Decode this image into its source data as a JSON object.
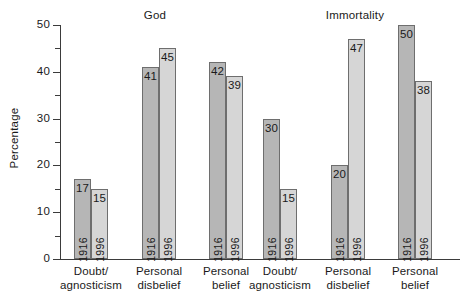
{
  "chart_data": {
    "type": "bar",
    "title": "",
    "xlabel": "",
    "ylabel": "Percentage",
    "ylim": [
      0,
      50
    ],
    "ytick_values": [
      0,
      10,
      20,
      30,
      40,
      50
    ],
    "ytick_labels": [
      "0",
      "10",
      "20",
      "30",
      "40",
      "50"
    ],
    "yminor_values": [
      5,
      15,
      25,
      35,
      45
    ],
    "grid": false,
    "legend_position": "none",
    "panels": [
      {
        "title": "God",
        "categories": [
          "Doubt/ agnosticism",
          "Personal disbelief",
          "Personal belief"
        ],
        "series": [
          {
            "name": "1916",
            "values": [
              17,
              41,
              42
            ]
          },
          {
            "name": "1996",
            "values": [
              15,
              45,
              39
            ]
          }
        ]
      },
      {
        "title": "Immortality",
        "categories": [
          "Doubt/ agnosticism",
          "Personal disbelief",
          "Personal belief"
        ],
        "series": [
          {
            "name": "1916",
            "values": [
              30,
              20,
              50
            ]
          },
          {
            "name": "1996",
            "values": [
              15,
              47,
              38
            ]
          }
        ]
      }
    ],
    "colors": {
      "bar_1916": "#b6b6b6",
      "bar_1996": "#d6d6d6",
      "bar_outline": "#6e6e6e",
      "axis": "#3b3b3b",
      "background": "#ffffff",
      "text": "#1a1a1a"
    }
  },
  "axis": {
    "ylabel": "Percentage",
    "ticks": [
      {
        "label": "50"
      },
      {
        "label": "40"
      },
      {
        "label": "30"
      },
      {
        "label": "20"
      },
      {
        "label": "10"
      },
      {
        "label": "0"
      }
    ]
  },
  "panels": [
    {
      "title": "God",
      "groups": [
        {
          "label_line1": "Doubt/",
          "label_line2": "agnosticism",
          "bars": [
            {
              "year": "1916",
              "value": "17"
            },
            {
              "year": "1996",
              "value": "15"
            }
          ]
        },
        {
          "label_line1": "Personal",
          "label_line2": "disbelief",
          "bars": [
            {
              "year": "1916",
              "value": "41"
            },
            {
              "year": "1996",
              "value": "45"
            }
          ]
        },
        {
          "label_line1": "Personal",
          "label_line2": "belief",
          "bars": [
            {
              "year": "1916",
              "value": "42"
            },
            {
              "year": "1996",
              "value": "39"
            }
          ]
        }
      ]
    },
    {
      "title": "Immortality",
      "groups": [
        {
          "label_line1": "Doubt/",
          "label_line2": "agnosticism",
          "bars": [
            {
              "year": "1916",
              "value": "30"
            },
            {
              "year": "1996",
              "value": "15"
            }
          ]
        },
        {
          "label_line1": "Personal",
          "label_line2": "disbelief",
          "bars": [
            {
              "year": "1916",
              "value": "20"
            },
            {
              "year": "1996",
              "value": "47"
            }
          ]
        },
        {
          "label_line1": "Personal",
          "label_line2": "belief",
          "bars": [
            {
              "year": "1916",
              "value": "50"
            },
            {
              "year": "1996",
              "value": "38"
            }
          ]
        }
      ]
    }
  ]
}
